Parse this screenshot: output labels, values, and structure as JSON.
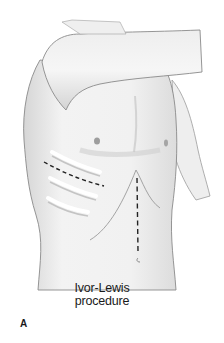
{
  "figure": {
    "caption_line1": "Ivor-Lewis",
    "caption_line2": "procedure",
    "panel_label": "A"
  },
  "colors": {
    "skin": "#f2f2f2",
    "shade": "#d9d9d9",
    "outline": "#8a8a8a",
    "incision": "#222222",
    "background": "#ffffff"
  },
  "icons": {
    "thoracotomy_incision": "dashed-curve",
    "abdominal_incision": "dashed-vertical-line"
  }
}
